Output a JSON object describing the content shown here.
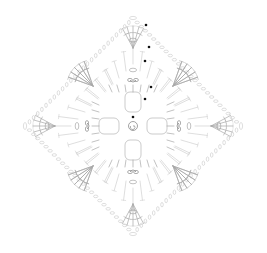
{
  "diagram": {
    "type": "crochet-chart",
    "shape": "square-on-point",
    "center": [
      133,
      126
    ],
    "half_diagonal": 111,
    "colors": {
      "background": "#ffffff",
      "stitch_light": "#d0d0d0",
      "stitch_mid": "#a8a8a8",
      "stitch_dark": "#8a8a8a",
      "round_start_marker": "#111111"
    },
    "rounds": 6,
    "round_start_markers": [
      {
        "x": 146,
        "y": 25
      },
      {
        "x": 149,
        "y": 47
      },
      {
        "x": 145,
        "y": 61
      },
      {
        "x": 151,
        "y": 87
      },
      {
        "x": 145,
        "y": 99
      },
      {
        "x": 133,
        "y": 117
      }
    ],
    "center_ring": "magic-ring-spiral"
  }
}
